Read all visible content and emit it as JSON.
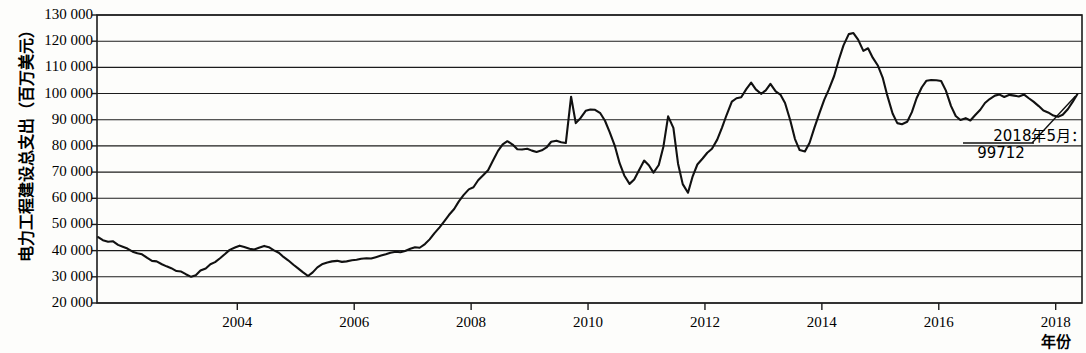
{
  "chart_data": {
    "type": "line",
    "title": "",
    "xlabel": "年份",
    "ylabel": "电力工程建设总支出（百万美元）",
    "ylim": [
      20000,
      130000
    ],
    "xlim": [
      2001.6,
      2018.45
    ],
    "grid": true,
    "legend": null,
    "y_ticks": [
      "20 000",
      "30 000",
      "40 000",
      "50 000",
      "60 000",
      "70 000",
      "80 000",
      "90 000",
      "100 000",
      "110 000",
      "120 000",
      "130 000"
    ],
    "y_tick_values": [
      20000,
      30000,
      40000,
      50000,
      60000,
      70000,
      80000,
      90000,
      100000,
      110000,
      120000,
      130000
    ],
    "x_ticks": [
      "2004",
      "2006",
      "2008",
      "2010",
      "2012",
      "2014",
      "2016",
      "2018"
    ],
    "x_tick_values": [
      2004,
      2006,
      2008,
      2010,
      2012,
      2014,
      2016,
      2018
    ],
    "line_color": "#111111",
    "series": [
      {
        "name": "电力工程建设总支出",
        "x": [
          2001.62,
          2001.7,
          2001.79,
          2001.87,
          2001.96,
          2002.04,
          2002.12,
          2002.21,
          2002.29,
          2002.37,
          2002.46,
          2002.54,
          2002.62,
          2002.71,
          2002.79,
          2002.87,
          2002.96,
          2003.04,
          2003.12,
          2003.21,
          2003.29,
          2003.37,
          2003.46,
          2003.54,
          2003.62,
          2003.71,
          2003.79,
          2003.87,
          2003.96,
          2004.04,
          2004.12,
          2004.21,
          2004.29,
          2004.37,
          2004.46,
          2004.54,
          2004.62,
          2004.71,
          2004.79,
          2004.87,
          2004.96,
          2005.04,
          2005.12,
          2005.21,
          2005.29,
          2005.37,
          2005.46,
          2005.54,
          2005.62,
          2005.71,
          2005.79,
          2005.87,
          2005.96,
          2006.04,
          2006.12,
          2006.21,
          2006.29,
          2006.37,
          2006.46,
          2006.54,
          2006.62,
          2006.71,
          2006.79,
          2006.87,
          2006.96,
          2007.04,
          2007.12,
          2007.21,
          2007.29,
          2007.37,
          2007.46,
          2007.54,
          2007.62,
          2007.71,
          2007.79,
          2007.87,
          2007.96,
          2008.04,
          2008.12,
          2008.21,
          2008.29,
          2008.37,
          2008.46,
          2008.54,
          2008.62,
          2008.71,
          2008.79,
          2008.87,
          2008.96,
          2009.04,
          2009.12,
          2009.21,
          2009.29,
          2009.37,
          2009.46,
          2009.54,
          2009.62,
          2009.71,
          2009.79,
          2009.87,
          2009.96,
          2010.04,
          2010.12,
          2010.21,
          2010.29,
          2010.37,
          2010.46,
          2010.54,
          2010.62,
          2010.71,
          2010.79,
          2010.87,
          2010.96,
          2011.04,
          2011.12,
          2011.21,
          2011.29,
          2011.37,
          2011.46,
          2011.54,
          2011.62,
          2011.71,
          2011.79,
          2011.87,
          2011.96,
          2012.04,
          2012.12,
          2012.21,
          2012.29,
          2012.37,
          2012.46,
          2012.54,
          2012.62,
          2012.71,
          2012.79,
          2012.87,
          2012.96,
          2013.04,
          2013.12,
          2013.21,
          2013.29,
          2013.37,
          2013.46,
          2013.54,
          2013.62,
          2013.71,
          2013.79,
          2013.87,
          2013.96,
          2014.04,
          2014.12,
          2014.21,
          2014.29,
          2014.37,
          2014.46,
          2014.54,
          2014.62,
          2014.71,
          2014.79,
          2014.87,
          2014.96,
          2015.04,
          2015.12,
          2015.21,
          2015.29,
          2015.37,
          2015.46,
          2015.54,
          2015.62,
          2015.71,
          2015.79,
          2015.87,
          2015.96,
          2016.04,
          2016.12,
          2016.21,
          2016.29,
          2016.37,
          2016.46,
          2016.54,
          2016.62,
          2016.71,
          2016.79,
          2016.87,
          2016.96,
          2017.04,
          2017.12,
          2017.21,
          2017.29,
          2017.37,
          2017.46,
          2017.54,
          2017.62,
          2017.71,
          2017.79,
          2017.87,
          2017.96,
          2018.04,
          2018.12,
          2018.21,
          2018.29,
          2018.37
        ],
        "values": [
          45200,
          44000,
          43400,
          43600,
          42200,
          41500,
          40800,
          39600,
          39000,
          38600,
          37200,
          36100,
          35900,
          34800,
          34000,
          33300,
          32200,
          32000,
          31000,
          30000,
          30600,
          32400,
          33200,
          34800,
          35600,
          37200,
          38700,
          40300,
          41200,
          41900,
          41400,
          40700,
          40400,
          41100,
          41800,
          41300,
          40200,
          39200,
          37600,
          36300,
          34600,
          33200,
          31800,
          30300,
          31700,
          33600,
          34900,
          35500,
          35900,
          36100,
          35700,
          35900,
          36300,
          36500,
          36900,
          37100,
          37000,
          37500,
          38100,
          38600,
          39200,
          39600,
          39400,
          39900,
          40700,
          41300,
          41100,
          42500,
          44300,
          46600,
          48900,
          51200,
          53600,
          55900,
          58800,
          61200,
          63400,
          64200,
          66900,
          68900,
          70700,
          74200,
          78100,
          80600,
          81800,
          80500,
          78700,
          78600,
          78900,
          78200,
          77700,
          78300,
          79400,
          81600,
          82000,
          81400,
          81100,
          98800,
          88700,
          90600,
          93400,
          93900,
          93800,
          92500,
          89600,
          85300,
          79900,
          73400,
          68700,
          65500,
          67200,
          70600,
          74400,
          72600,
          69800,
          72700,
          79800,
          91300,
          86900,
          73200,
          65400,
          62100,
          68400,
          72900,
          75200,
          77400,
          78900,
          82400,
          86900,
          91800,
          96900,
          98200,
          98600,
          101800,
          104200,
          101600,
          99900,
          101200,
          103700,
          100800,
          99600,
          96400,
          89700,
          82600,
          78400,
          77900,
          81200,
          86800,
          92600,
          97600,
          101600,
          106700,
          112900,
          118400,
          122700,
          123100,
          120600,
          116300,
          117300,
          113700,
          110600,
          106100,
          99200,
          92400,
          88700,
          88300,
          89200,
          92900,
          98200,
          102400,
          104900,
          105200,
          105100,
          104800,
          101200,
          95200,
          91400,
          89900,
          90600,
          89700,
          91700,
          93800,
          96400,
          97900,
          99200,
          99600,
          98700,
          99500,
          99200,
          98900,
          99600,
          98200,
          96900,
          95200,
          93500,
          92800,
          91600,
          91100,
          91900,
          94100,
          96800,
          99712
        ]
      }
    ],
    "annotations": [
      {
        "label_line1": "2018年5月：",
        "label_line2": "99712",
        "point_x": 2018.37,
        "point_y": 99712
      }
    ]
  }
}
